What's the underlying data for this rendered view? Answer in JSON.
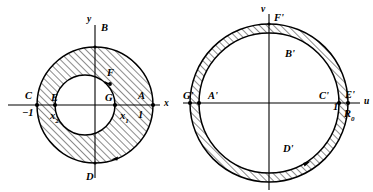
{
  "figure": {
    "caption": "",
    "panels": [
      {
        "id": "z-plane",
        "name": "left-panel",
        "axes": {
          "x_label": "x",
          "y_label": "y"
        },
        "shading": "hatched-annulus",
        "geometry": {
          "outer_center": [
            95,
            105
          ],
          "outer_radius": 58,
          "inner_center": [
            85,
            105
          ],
          "inner_radius": 30
        },
        "labels": [
          {
            "key": "B",
            "text": "B",
            "x": 101,
            "y": 31,
            "name": "point-label-B"
          },
          {
            "key": "C",
            "text": "C",
            "x": 25,
            "y": 99,
            "name": "point-label-C"
          },
          {
            "key": "m1",
            "text": "−1",
            "x": 22,
            "y": 116,
            "name": "tick-label-minus-one"
          },
          {
            "key": "E",
            "text": "E",
            "x": 51,
            "y": 101,
            "name": "point-label-E"
          },
          {
            "key": "x2",
            "text": "x",
            "sub": "2",
            "x": 50,
            "y": 119,
            "name": "tick-label-x2"
          },
          {
            "key": "G",
            "text": "G",
            "x": 105,
            "y": 101,
            "name": "point-label-G"
          },
          {
            "key": "A",
            "text": "A",
            "x": 138,
            "y": 99,
            "name": "point-label-A"
          },
          {
            "key": "x1",
            "text": "x",
            "sub": "1",
            "x": 120,
            "y": 119,
            "name": "tick-label-x1"
          },
          {
            "key": "one",
            "text": "1",
            "x": 138,
            "y": 118,
            "name": "tick-label-one"
          },
          {
            "key": "D",
            "text": "D",
            "x": 86,
            "y": 180,
            "name": "point-label-D"
          },
          {
            "key": "F",
            "text": "F",
            "x": 107,
            "y": 76,
            "name": "point-label-F"
          },
          {
            "key": "x",
            "text": "x",
            "x": 164,
            "y": 106,
            "name": "axis-label-x"
          },
          {
            "key": "y",
            "text": "y",
            "x": 87,
            "y": 22,
            "name": "axis-label-y"
          }
        ]
      },
      {
        "id": "w-plane",
        "name": "right-panel",
        "axes": {
          "x_label": "u",
          "y_label": "v"
        },
        "shading": "hatched-annulus",
        "geometry": {
          "outer_center": [
            269,
            103
          ],
          "outer_radius": 79,
          "inner_center": [
            269,
            103
          ],
          "inner_radius": 70
        },
        "labels": [
          {
            "key": "Fp",
            "text": "F'",
            "x": 274,
            "y": 21,
            "name": "point-label-F-prime"
          },
          {
            "key": "Gp",
            "text": "G'",
            "x": 183,
            "y": 99,
            "name": "point-label-G-prime"
          },
          {
            "key": "Ap",
            "text": "A'",
            "x": 208,
            "y": 99,
            "name": "point-label-A-prime"
          },
          {
            "key": "Cp",
            "text": "C'",
            "x": 319,
            "y": 99,
            "name": "point-label-C-prime"
          },
          {
            "key": "one",
            "text": "1",
            "x": 333,
            "y": 110,
            "name": "tick-label-one-right"
          },
          {
            "key": "Ep",
            "text": "E'",
            "x": 345,
            "y": 98,
            "name": "point-label-E-prime"
          },
          {
            "key": "R0",
            "text": "R",
            "sub": "0",
            "x": 344,
            "y": 117,
            "name": "radius-label-R0"
          },
          {
            "key": "Bp",
            "text": "B'",
            "x": 285,
            "y": 57,
            "name": "point-label-B-prime"
          },
          {
            "key": "Dp",
            "text": "D'",
            "x": 283,
            "y": 152,
            "name": "point-label-D-prime"
          },
          {
            "key": "u",
            "text": "u",
            "x": 364,
            "y": 104,
            "name": "axis-label-u"
          },
          {
            "key": "v",
            "text": "v",
            "x": 261,
            "y": 12,
            "name": "axis-label-v"
          }
        ]
      }
    ],
    "style": {
      "stroke": "#000000",
      "hatch": "#000000",
      "background": "#ffffff"
    }
  }
}
